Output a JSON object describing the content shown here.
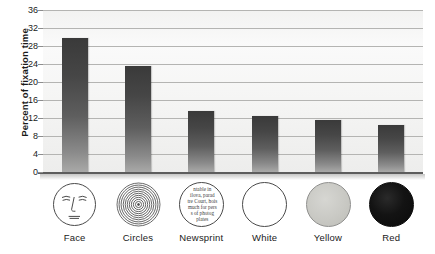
{
  "chart_data": {
    "type": "bar",
    "title": "",
    "xlabel": "",
    "ylabel": "Percent of fixation time",
    "categories": [
      "Face",
      "Circles",
      "Newsprint",
      "White",
      "Yellow",
      "Red"
    ],
    "values": [
      29.7,
      23.5,
      13.5,
      12.5,
      11.5,
      10.5
    ],
    "ylim": [
      0,
      36
    ],
    "yticks": [
      0,
      4,
      8,
      12,
      16,
      20,
      24,
      28,
      32,
      36
    ],
    "ytick_labels": [
      "0",
      "4",
      "8",
      "12",
      "16",
      "20",
      "24",
      "28",
      "32",
      "36"
    ],
    "grid": true,
    "legend": "none",
    "series": [
      {
        "name": "Percent of fixation time",
        "values": [
          29.7,
          23.5,
          13.5,
          12.5,
          11.5,
          10.5
        ]
      }
    ]
  },
  "axis": {
    "y_title": "Percent of fixation time"
  },
  "icons": [
    {
      "name": "face-icon",
      "kind": "face",
      "caption": "Face"
    },
    {
      "name": "concentric-circles-icon",
      "kind": "rings",
      "caption": "Circles"
    },
    {
      "name": "newsprint-icon",
      "kind": "newsprint",
      "caption": "Newsprint",
      "text_lines": [
        "ntable in",
        "ilova, parad",
        "tre Court, hois",
        "much for pers",
        "s of photog",
        "plates"
      ]
    },
    {
      "name": "white-disc-icon",
      "kind": "white",
      "caption": "White"
    },
    {
      "name": "yellow-disc-icon",
      "kind": "yellow",
      "caption": "Yellow"
    },
    {
      "name": "red-disc-icon",
      "kind": "red",
      "caption": "Red"
    }
  ],
  "colors": {
    "bar_dark": "#3a3a3a",
    "bar_light": "#a9a9a8",
    "gridline": "#b4b4b2",
    "axis": "#5d5d5d",
    "plot_background": "#f5f5f4",
    "text": "#1a1a1a"
  }
}
